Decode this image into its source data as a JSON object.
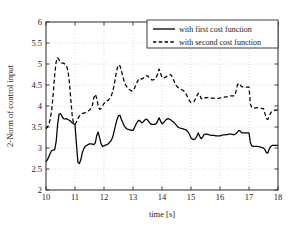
{
  "chart_data": {
    "type": "line",
    "title": "",
    "xlabel": "time [s]",
    "ylabel": "2-Norm of control input",
    "xlim": [
      10,
      18
    ],
    "ylim": [
      2,
      6
    ],
    "xticks": [
      "10",
      "11",
      "12",
      "13",
      "14",
      "15",
      "16",
      "17",
      "18"
    ],
    "xtick_values": [
      10,
      11,
      12,
      13,
      14,
      15,
      16,
      17,
      18
    ],
    "yticks": [
      "2",
      "2.5",
      "3",
      "3.5",
      "4",
      "4.5",
      "5",
      "5.5",
      "6"
    ],
    "ytick_values": [
      2,
      2.5,
      3,
      3.5,
      4,
      4.5,
      5,
      5.5,
      6
    ],
    "grid": true,
    "legend_position": "top-right",
    "series": [
      {
        "name": "with first cost function",
        "style": "solid",
        "color": "#000000",
        "x": [
          10.0,
          10.05,
          10.1,
          10.15,
          10.2,
          10.25,
          10.3,
          10.35,
          10.4,
          10.45,
          10.5,
          10.55,
          10.6,
          10.65,
          10.7,
          10.75,
          10.8,
          10.85,
          10.9,
          10.95,
          11.0,
          11.05,
          11.1,
          11.15,
          11.2,
          11.25,
          11.3,
          11.35,
          11.4,
          11.45,
          11.5,
          11.55,
          11.6,
          11.65,
          11.7,
          11.75,
          11.8,
          11.85,
          11.9,
          11.95,
          12.0,
          12.05,
          12.1,
          12.15,
          12.2,
          12.25,
          12.3,
          12.35,
          12.4,
          12.45,
          12.5,
          12.55,
          12.6,
          12.65,
          12.7,
          12.75,
          12.8,
          12.85,
          12.9,
          12.95,
          13.0,
          13.05,
          13.1,
          13.15,
          13.2,
          13.25,
          13.3,
          13.35,
          13.4,
          13.45,
          13.5,
          13.55,
          13.6,
          13.65,
          13.7,
          13.75,
          13.8,
          13.85,
          13.9,
          13.95,
          14.0,
          14.05,
          14.1,
          14.15,
          14.2,
          14.25,
          14.3,
          14.35,
          14.4,
          14.45,
          14.5,
          14.55,
          14.6,
          14.65,
          14.7,
          14.75,
          14.8,
          14.85,
          14.9,
          14.95,
          15.0,
          15.05,
          15.1,
          15.15,
          15.2,
          15.25,
          15.3,
          15.35,
          15.4,
          15.45,
          15.5,
          15.55,
          15.6,
          15.65,
          15.7,
          15.75,
          15.8,
          15.85,
          15.9,
          15.95,
          16.0,
          16.05,
          16.1,
          16.15,
          16.2,
          16.25,
          16.3,
          16.35,
          16.4,
          16.45,
          16.5,
          16.55,
          16.6,
          16.65,
          16.7,
          16.75,
          16.8,
          16.85,
          16.9,
          16.95,
          17.0,
          17.05,
          17.1,
          17.15,
          17.2,
          17.25,
          17.3,
          17.35,
          17.4,
          17.45,
          17.5,
          17.55,
          17.6,
          17.65,
          17.7,
          17.75,
          17.8,
          17.85,
          17.9,
          17.95,
          18.0
        ],
        "y": [
          2.67,
          2.72,
          2.8,
          2.88,
          2.94,
          2.95,
          2.96,
          3.15,
          3.55,
          3.8,
          3.82,
          3.76,
          3.7,
          3.69,
          3.7,
          3.68,
          3.66,
          3.64,
          3.6,
          3.58,
          3.55,
          3.1,
          2.66,
          2.63,
          2.72,
          2.88,
          2.98,
          3.04,
          3.06,
          3.08,
          3.1,
          3.1,
          3.09,
          3.08,
          3.12,
          3.3,
          3.38,
          3.24,
          3.1,
          3.04,
          3.05,
          3.07,
          3.08,
          3.1,
          3.14,
          3.18,
          3.26,
          3.4,
          3.55,
          3.68,
          3.77,
          3.78,
          3.68,
          3.6,
          3.52,
          3.48,
          3.45,
          3.44,
          3.43,
          3.42,
          3.42,
          3.48,
          3.56,
          3.62,
          3.66,
          3.64,
          3.6,
          3.62,
          3.66,
          3.69,
          3.67,
          3.62,
          3.58,
          3.56,
          3.56,
          3.56,
          3.58,
          3.64,
          3.72,
          3.64,
          3.58,
          3.6,
          3.64,
          3.68,
          3.7,
          3.69,
          3.67,
          3.64,
          3.62,
          3.58,
          3.54,
          3.5,
          3.48,
          3.47,
          3.46,
          3.45,
          3.44,
          3.42,
          3.38,
          3.32,
          3.24,
          3.21,
          3.2,
          3.22,
          3.28,
          3.36,
          3.28,
          3.22,
          3.26,
          3.32,
          3.33,
          3.33,
          3.32,
          3.31,
          3.3,
          3.3,
          3.3,
          3.29,
          3.29,
          3.29,
          3.29,
          3.3,
          3.31,
          3.31,
          3.32,
          3.32,
          3.33,
          3.33,
          3.33,
          3.32,
          3.32,
          3.34,
          3.38,
          3.42,
          3.4,
          3.36,
          3.36,
          3.36,
          3.36,
          3.36,
          3.36,
          3.12,
          3.05,
          3.04,
          3.04,
          3.04,
          3.04,
          3.03,
          3.02,
          3.01,
          3.0,
          2.96,
          2.89,
          2.88,
          2.98,
          3.04,
          3.06,
          3.06,
          3.06,
          3.06,
          3.07
        ]
      },
      {
        "name": "with second cost function",
        "style": "dashed",
        "color": "#000000",
        "x": [
          10.0,
          10.05,
          10.1,
          10.15,
          10.2,
          10.25,
          10.3,
          10.35,
          10.4,
          10.45,
          10.5,
          10.55,
          10.6,
          10.65,
          10.7,
          10.75,
          10.8,
          10.85,
          10.9,
          10.95,
          11.0,
          11.05,
          11.1,
          11.15,
          11.2,
          11.25,
          11.3,
          11.35,
          11.4,
          11.45,
          11.5,
          11.55,
          11.6,
          11.65,
          11.7,
          11.75,
          11.8,
          11.85,
          11.9,
          11.95,
          12.0,
          12.05,
          12.1,
          12.15,
          12.2,
          12.25,
          12.3,
          12.35,
          12.4,
          12.45,
          12.5,
          12.55,
          12.6,
          12.65,
          12.7,
          12.75,
          12.8,
          12.85,
          12.9,
          12.95,
          13.0,
          13.05,
          13.1,
          13.15,
          13.2,
          13.25,
          13.3,
          13.35,
          13.4,
          13.45,
          13.5,
          13.55,
          13.6,
          13.65,
          13.7,
          13.75,
          13.8,
          13.85,
          13.9,
          13.95,
          14.0,
          14.05,
          14.1,
          14.15,
          14.2,
          14.25,
          14.3,
          14.35,
          14.4,
          14.45,
          14.5,
          14.55,
          14.6,
          14.65,
          14.7,
          14.75,
          14.8,
          14.85,
          14.9,
          14.95,
          15.0,
          15.05,
          15.1,
          15.15,
          15.2,
          15.25,
          15.3,
          15.35,
          15.4,
          15.45,
          15.5,
          15.55,
          15.6,
          15.65,
          15.7,
          15.75,
          15.8,
          15.85,
          15.9,
          15.95,
          16.0,
          16.05,
          16.1,
          16.15,
          16.2,
          16.25,
          16.3,
          16.35,
          16.4,
          16.45,
          16.5,
          16.55,
          16.6,
          16.65,
          16.7,
          16.75,
          16.8,
          16.85,
          16.9,
          16.95,
          17.0,
          17.05,
          17.1,
          17.15,
          17.2,
          17.25,
          17.3,
          17.35,
          17.4,
          17.45,
          17.5,
          17.55,
          17.6,
          17.65,
          17.7,
          17.75,
          17.8,
          17.85,
          17.9,
          17.95,
          18.0
        ],
        "y": [
          3.46,
          3.5,
          3.56,
          3.7,
          3.92,
          4.3,
          4.74,
          5.05,
          5.15,
          5.1,
          5.04,
          5.02,
          5.02,
          5.0,
          4.96,
          4.86,
          4.62,
          4.2,
          3.8,
          3.58,
          3.56,
          3.62,
          3.7,
          3.76,
          3.8,
          3.82,
          3.83,
          3.84,
          3.86,
          3.88,
          3.9,
          3.94,
          4.02,
          4.2,
          4.28,
          4.18,
          4.0,
          3.92,
          3.94,
          4.0,
          4.06,
          4.1,
          4.12,
          4.14,
          4.18,
          4.24,
          4.34,
          4.5,
          4.7,
          4.88,
          4.98,
          4.96,
          4.84,
          4.7,
          4.58,
          4.5,
          4.44,
          4.4,
          4.38,
          4.36,
          4.36,
          4.42,
          4.5,
          4.58,
          4.64,
          4.66,
          4.64,
          4.66,
          4.7,
          4.72,
          4.72,
          4.68,
          4.64,
          4.62,
          4.62,
          4.64,
          4.68,
          4.76,
          4.88,
          4.78,
          4.68,
          4.66,
          4.68,
          4.7,
          4.72,
          4.74,
          4.75,
          4.7,
          4.62,
          4.54,
          4.48,
          4.44,
          4.42,
          4.4,
          4.38,
          4.36,
          4.32,
          4.26,
          4.18,
          4.12,
          4.08,
          4.08,
          4.1,
          4.16,
          4.24,
          4.3,
          4.28,
          4.18,
          4.16,
          4.18,
          4.2,
          4.2,
          4.2,
          4.19,
          4.19,
          4.19,
          4.18,
          4.18,
          4.18,
          4.18,
          4.19,
          4.2,
          4.2,
          4.21,
          4.22,
          4.22,
          4.23,
          4.24,
          4.24,
          4.24,
          4.24,
          4.34,
          4.5,
          4.54,
          4.5,
          4.46,
          4.45,
          4.45,
          4.45,
          4.45,
          4.45,
          4.04,
          3.96,
          3.95,
          3.95,
          3.96,
          3.96,
          3.96,
          3.95,
          3.94,
          3.94,
          3.82,
          3.7,
          3.68,
          3.76,
          3.84,
          3.88,
          3.89,
          3.9,
          3.9,
          3.91
        ]
      }
    ]
  }
}
